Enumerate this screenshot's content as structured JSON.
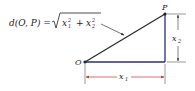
{
  "diagram": {
    "formula": {
      "lhs": "d(O, P) =",
      "radicand_term1_base": "x",
      "radicand_term1_sub": "1",
      "radicand_term1_sup": "2",
      "plus": "+",
      "radicand_term2_base": "x",
      "radicand_term2_sub": "2",
      "radicand_term2_sup": "2"
    },
    "points": {
      "origin_label": "O",
      "point_label": "P"
    },
    "dimensions": {
      "horizontal_base": "x",
      "horizontal_sub": "1",
      "vertical_base": "x",
      "vertical_sub": "2"
    },
    "colors": {
      "hypotenuse": "#2a2a2a",
      "legs": "#2b2f7a",
      "dimension_arrows": "#c0392b",
      "extension_lines": "#333333"
    }
  }
}
